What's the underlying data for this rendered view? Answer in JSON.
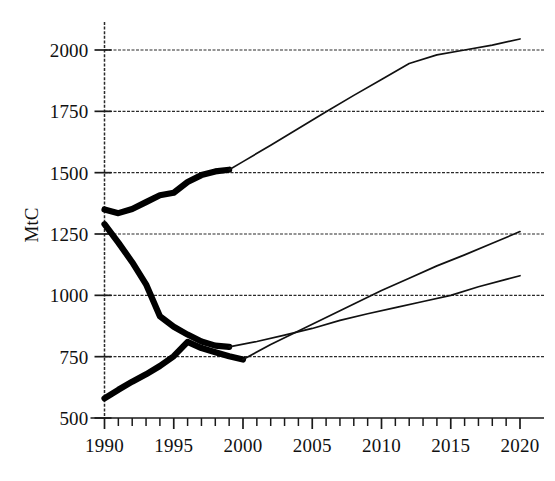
{
  "figure": {
    "title": "",
    "background_color": "#ffffff",
    "ink_color": "#000000"
  },
  "axes": {
    "y_axis_title": "MtC",
    "y_tick_labels": [
      "2000",
      "1750",
      "1500",
      "1250",
      "1000",
      "750",
      "500"
    ],
    "x_tick_labels": [
      "1990",
      "1995",
      "2000",
      "2005",
      "2010",
      "2015",
      "2020"
    ]
  },
  "chart_data": {
    "type": "line",
    "title": "",
    "xlabel": "",
    "ylabel": "MtC",
    "xlim": [
      1990,
      2020
    ],
    "ylim": [
      500,
      2050
    ],
    "grid": true,
    "legend_position": "none",
    "x_tick_values": [
      1990,
      1995,
      2000,
      2005,
      2010,
      2015,
      2020
    ],
    "x_minor_tick_step": 1,
    "y_tick_values": [
      500,
      750,
      1000,
      1250,
      1500,
      1750,
      2000
    ],
    "gridline_values": [
      750,
      1000,
      1250,
      1500,
      1750,
      2000
    ],
    "series": [
      {
        "name": "upper-historical",
        "style": "thick-solid",
        "segment": "historical",
        "x": [
          1990,
          1991,
          1992,
          1993,
          1994,
          1995,
          1996,
          1997,
          1998,
          1999
        ],
        "values": [
          1350,
          1335,
          1352,
          1380,
          1408,
          1418,
          1462,
          1490,
          1505,
          1512
        ]
      },
      {
        "name": "upper-projection",
        "style": "thin-solid",
        "segment": "projection",
        "x": [
          1999,
          2000,
          2002,
          2004,
          2006,
          2008,
          2010,
          2012,
          2014,
          2016,
          2018,
          2020
        ],
        "values": [
          1512,
          1545,
          1612,
          1680,
          1748,
          1815,
          1880,
          1945,
          1980,
          2000,
          2020,
          2045
        ]
      },
      {
        "name": "middle-historical",
        "style": "thick-solid",
        "segment": "historical",
        "x": [
          1990,
          1991,
          1992,
          1993,
          1994,
          1995,
          1996,
          1997,
          1998,
          1999
        ],
        "values": [
          1290,
          1215,
          1135,
          1045,
          915,
          872,
          840,
          812,
          795,
          790
        ]
      },
      {
        "name": "middle-projection",
        "style": "thin-solid",
        "segment": "projection",
        "x": [
          1999,
          2001,
          2003,
          2005,
          2007,
          2009,
          2011,
          2013,
          2015,
          2017,
          2019,
          2020
        ],
        "values": [
          790,
          812,
          838,
          865,
          898,
          925,
          950,
          975,
          1000,
          1035,
          1065,
          1080
        ]
      },
      {
        "name": "lower-historical",
        "style": "thick-solid",
        "segment": "historical",
        "x": [
          1990,
          1991,
          1992,
          1993,
          1994,
          1995,
          1996,
          1997,
          1998,
          1999,
          2000
        ],
        "values": [
          580,
          615,
          648,
          678,
          712,
          752,
          810,
          785,
          768,
          752,
          738
        ]
      },
      {
        "name": "lower-projection",
        "style": "thin-solid",
        "segment": "projection",
        "x": [
          2000,
          2002,
          2004,
          2006,
          2008,
          2010,
          2012,
          2014,
          2016,
          2018,
          2020
        ],
        "values": [
          738,
          800,
          855,
          910,
          965,
          1020,
          1070,
          1120,
          1165,
          1212,
          1260
        ]
      }
    ]
  }
}
